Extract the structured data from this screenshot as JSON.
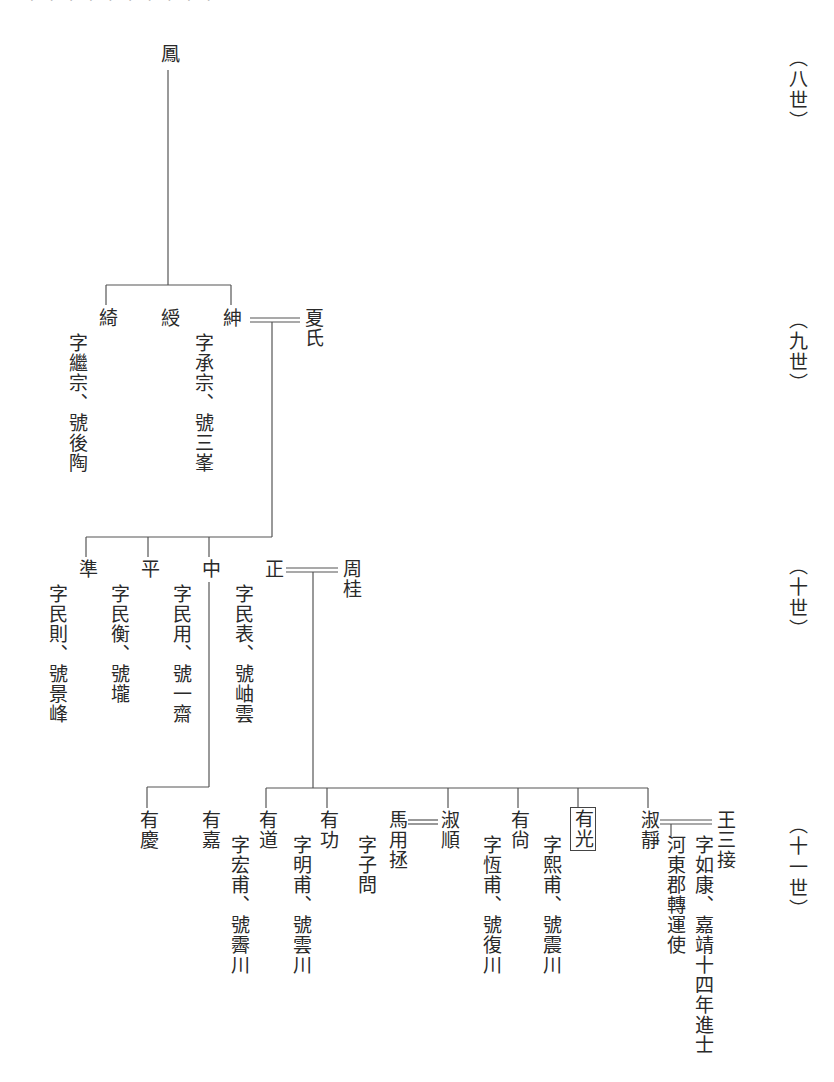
{
  "top_cutoff_text": "· · · · · · · · · ·",
  "generations": [
    {
      "label": "（八世）",
      "x": 786,
      "y": 48
    },
    {
      "label": "（九世）",
      "x": 786,
      "y": 310
    },
    {
      "label": "（十世）",
      "x": 786,
      "y": 556
    },
    {
      "label": "（十一世）",
      "x": 786,
      "y": 815
    }
  ],
  "root": {
    "name": "鳳"
  },
  "gen9": [
    {
      "name": "綺",
      "note": "字繼宗、號後陶"
    },
    {
      "name": "綬",
      "note": ""
    },
    {
      "name": "紳",
      "note": "字承宗、號三峯",
      "spouse": "夏氏"
    }
  ],
  "gen10": [
    {
      "name": "準",
      "note": "字民則、號景峰"
    },
    {
      "name": "平",
      "note": "字民衡、號壠"
    },
    {
      "name": "中",
      "note": "字民用、號一齋"
    },
    {
      "name": "正",
      "note": "字民表、號岫雲",
      "spouse": "周桂"
    }
  ],
  "gen11_zhong": [
    {
      "name": "有慶",
      "note": ""
    },
    {
      "name": "有嘉",
      "note": ""
    }
  ],
  "gen11_zheng": [
    {
      "name": "有道",
      "note": "字宏甫、號霽川"
    },
    {
      "name": "有功",
      "note": "字明甫、號雲川"
    },
    {
      "name": "淑順",
      "note": "",
      "spouse": "馬用拯",
      "spouse_note": "字子問"
    },
    {
      "name": "有尙",
      "note": "字恆甫、號復川"
    },
    {
      "name": "有光",
      "note": "字熙甫、號震川",
      "highlighted": true
    },
    {
      "name": "淑靜",
      "note": "",
      "spouse": "王三接",
      "spouse_note": "字如康、嘉靖十四年進士",
      "spouse_note2": "河東郡轉運使"
    }
  ]
}
